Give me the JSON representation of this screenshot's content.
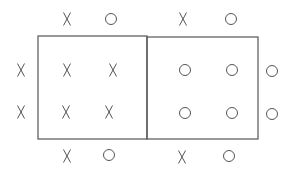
{
  "diagram": {
    "stroke_color": "#555555",
    "boxes": [
      {
        "id": "left-box",
        "x1": 38,
        "y1": 36,
        "x2": 147,
        "y2": 139
      },
      {
        "id": "right-box",
        "x1": 147,
        "y1": 37,
        "x2": 258,
        "y2": 139
      }
    ],
    "marks": [
      {
        "symbol": "X",
        "x": 67,
        "y": 19,
        "region": "top-left-outside"
      },
      {
        "symbol": "O",
        "x": 111,
        "y": 19,
        "region": "top-left-outside"
      },
      {
        "symbol": "X",
        "x": 183,
        "y": 19,
        "region": "top-right-outside"
      },
      {
        "symbol": "O",
        "x": 231,
        "y": 19,
        "region": "top-right-outside"
      },
      {
        "symbol": "X",
        "x": 21,
        "y": 70,
        "region": "left-outside"
      },
      {
        "symbol": "X",
        "x": 67,
        "y": 70,
        "region": "left-box"
      },
      {
        "symbol": "X",
        "x": 113,
        "y": 70,
        "region": "left-box"
      },
      {
        "symbol": "O",
        "x": 185,
        "y": 70,
        "region": "right-box"
      },
      {
        "symbol": "O",
        "x": 232,
        "y": 70,
        "region": "right-box"
      },
      {
        "symbol": "O",
        "x": 272,
        "y": 71,
        "region": "right-outside"
      },
      {
        "symbol": "X",
        "x": 21,
        "y": 112,
        "region": "left-outside"
      },
      {
        "symbol": "X",
        "x": 66,
        "y": 112,
        "region": "left-box"
      },
      {
        "symbol": "X",
        "x": 109,
        "y": 112,
        "region": "left-box"
      },
      {
        "symbol": "O",
        "x": 185,
        "y": 113,
        "region": "right-box"
      },
      {
        "symbol": "O",
        "x": 232,
        "y": 113,
        "region": "right-box"
      },
      {
        "symbol": "O",
        "x": 272,
        "y": 114,
        "region": "right-outside"
      },
      {
        "symbol": "X",
        "x": 67,
        "y": 156,
        "region": "bottom-left-outside"
      },
      {
        "symbol": "O",
        "x": 109,
        "y": 155,
        "region": "bottom-left-outside"
      },
      {
        "symbol": "X",
        "x": 182,
        "y": 157,
        "region": "bottom-right-outside"
      },
      {
        "symbol": "O",
        "x": 229,
        "y": 156,
        "region": "bottom-right-outside"
      }
    ]
  }
}
